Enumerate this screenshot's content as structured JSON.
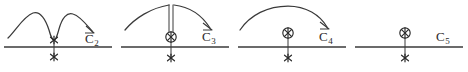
{
  "figure": {
    "width": 468,
    "height": 72,
    "background": "#ffffff",
    "ink_color": "#3a3a3a",
    "symbol_color": "#2b2b2b"
  },
  "panels": [
    {
      "id": "panel-c2",
      "label": "C",
      "subscript": "2",
      "x_offset": 0,
      "axis": {
        "y": 47,
        "x_start": 4,
        "x_end": 112
      },
      "curve_type": "double-hump-with-deep-notch",
      "arrow_direction": "right-down",
      "markers": [
        {
          "type": "star",
          "x": 54,
          "y": 40
        },
        {
          "type": "star",
          "x": 54,
          "y": 57
        }
      ],
      "stem": {
        "x": 54,
        "y_top": 40,
        "y_bottom": 57
      },
      "label_x": 85,
      "label_y": 32
    },
    {
      "id": "panel-c3",
      "label": "C",
      "subscript": "3",
      "x_offset": 117,
      "axis": {
        "y": 47,
        "x_start": 4,
        "x_end": 112
      },
      "curve_type": "single-arc-with-vertical-double-stem",
      "arrow_direction": "right-down",
      "markers": [
        {
          "type": "circled-x",
          "x": 54,
          "y": 37
        },
        {
          "type": "star",
          "x": 54,
          "y": 58
        }
      ],
      "stem": {
        "x": 54,
        "y_top": 37,
        "y_bottom": 58
      },
      "label_x": 85,
      "label_y": 30
    },
    {
      "id": "panel-c4",
      "label": "C",
      "subscript": "4",
      "x_offset": 234,
      "axis": {
        "y": 47,
        "x_start": 4,
        "x_end": 112
      },
      "curve_type": "single-arc",
      "arrow_direction": "right-down",
      "markers": [
        {
          "type": "circled-x",
          "x": 54,
          "y": 33
        },
        {
          "type": "star",
          "x": 54,
          "y": 58
        }
      ],
      "stem": {
        "x": 54,
        "y_top": 33,
        "y_bottom": 58
      },
      "label_x": 85,
      "label_y": 30
    },
    {
      "id": "panel-c5",
      "label": "C",
      "subscript": "5",
      "x_offset": 351,
      "axis": {
        "y": 47,
        "x_start": 4,
        "x_end": 112
      },
      "curve_type": "none",
      "arrow_direction": "none",
      "markers": [
        {
          "type": "circled-x",
          "x": 54,
          "y": 33
        },
        {
          "type": "star",
          "x": 54,
          "y": 58
        }
      ],
      "stem": {
        "x": 54,
        "y_top": 33,
        "y_bottom": 58
      },
      "label_x": 85,
      "label_y": 30
    }
  ]
}
